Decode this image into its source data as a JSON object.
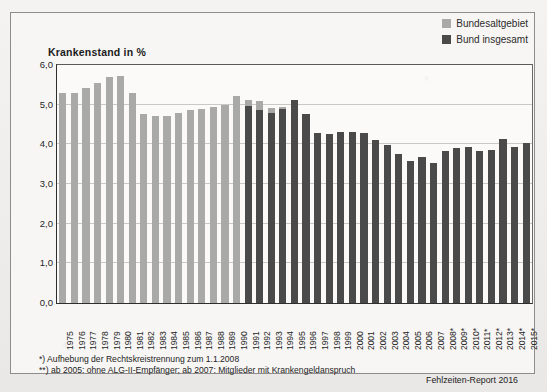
{
  "legend": {
    "items": [
      {
        "label": "Bundesaltgebiet",
        "color": "#a9a9a7",
        "key": "bundesaltgebiet"
      },
      {
        "label": "Bund insgesamt",
        "color": "#4a4a4a",
        "key": "bund_insgesamt"
      }
    ]
  },
  "footnotes": {
    "line1": "*) Aufhebung der Rechtskreistrennung zum 1.1.2008",
    "line2": "**) ab 2005: ohne ALG-II-Empfänger; ab 2007: Mitglieder mit Krankengeldanspruch"
  },
  "source": "Fehlzeiten-Report 2016",
  "chart_data": {
    "type": "bar",
    "title": "Krankenstand in %",
    "xlabel": "",
    "ylabel": "Krankenstand in %",
    "ylim": [
      0,
      6
    ],
    "ytick_labels": [
      "0,0",
      "1,0",
      "2,0",
      "3,0",
      "4,0",
      "5,0",
      "6,0"
    ],
    "ytick_values": [
      0,
      1,
      2,
      3,
      4,
      5,
      6
    ],
    "grid": true,
    "legend_position": "top-right",
    "categories": [
      "1975",
      "1976",
      "1977",
      "1978",
      "1979",
      "1980",
      "1981",
      "1982",
      "1983",
      "1984",
      "1985",
      "1986",
      "1987",
      "1988",
      "1989",
      "1990",
      "1991",
      "1992",
      "1993",
      "1994",
      "1995",
      "1996",
      "1997",
      "1998",
      "1999",
      "2000",
      "2001",
      "2002",
      "2003",
      "2004",
      "2005",
      "2006",
      "2007",
      "2008*",
      "2009*",
      "2010*",
      "2011*",
      "2012*",
      "2013*",
      "2014*",
      "2015*"
    ],
    "series": [
      {
        "name": "Bundesaltgebiet",
        "color": "#a9a9a7",
        "values": [
          5.29,
          5.3,
          5.43,
          5.55,
          5.7,
          5.72,
          5.3,
          4.76,
          4.71,
          4.71,
          4.79,
          4.86,
          4.9,
          4.95,
          5.0,
          5.21,
          5.13,
          5.09,
          4.91,
          4.95,
          null,
          null,
          null,
          null,
          null,
          null,
          null,
          null,
          null,
          null,
          null,
          null,
          null,
          null,
          null,
          null,
          null,
          null,
          null,
          null,
          null
        ]
      },
      {
        "name": "Bund insgesamt",
        "color": "#4a4a4a",
        "values": [
          null,
          null,
          null,
          null,
          null,
          null,
          null,
          null,
          null,
          null,
          null,
          null,
          null,
          null,
          null,
          null,
          4.96,
          4.86,
          4.78,
          4.89,
          5.13,
          4.76,
          4.28,
          4.27,
          4.3,
          4.31,
          4.28,
          4.12,
          3.99,
          3.76,
          3.59,
          3.67,
          3.53,
          3.82,
          3.91,
          3.93,
          3.83,
          3.85,
          4.13,
          3.94,
          4.03
        ]
      }
    ]
  }
}
